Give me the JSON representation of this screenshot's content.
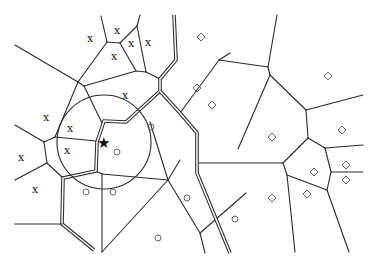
{
  "diagram": {
    "classes": [
      {
        "name": "x",
        "marker": "x"
      },
      {
        "name": "circle",
        "marker": "o"
      },
      {
        "name": "diamond",
        "marker": "◇"
      }
    ],
    "query_point": {
      "marker": "★",
      "x": 104,
      "y": 142
    },
    "query_circle": {
      "cx": 104,
      "cy": 142,
      "r": 47
    },
    "x_points": [
      {
        "label": "x",
        "x": 91,
        "y": 38
      },
      {
        "label": "x",
        "x": 119,
        "y": 31
      },
      {
        "label": "x",
        "x": 133,
        "y": 43
      },
      {
        "label": "x",
        "x": 150,
        "y": 42
      },
      {
        "label": "x",
        "x": 115,
        "y": 56
      },
      {
        "label": "x",
        "x": 126,
        "y": 96
      },
      {
        "label": "x",
        "x": 47,
        "y": 117
      },
      {
        "label": "x",
        "x": 71,
        "y": 128
      },
      {
        "label": "x",
        "x": 68,
        "y": 150
      },
      {
        "label": "x",
        "x": 22,
        "y": 157
      },
      {
        "label": "x",
        "x": 36,
        "y": 189
      }
    ],
    "o_points": [
      {
        "x": 150,
        "y": 127
      },
      {
        "x": 116,
        "y": 152
      },
      {
        "x": 86,
        "y": 192
      },
      {
        "x": 113,
        "y": 192
      },
      {
        "x": 187,
        "y": 198
      },
      {
        "x": 235,
        "y": 218
      },
      {
        "x": 158,
        "y": 238
      }
    ],
    "diamond_points": [
      {
        "x": 201,
        "y": 37
      },
      {
        "x": 328,
        "y": 76
      },
      {
        "x": 197,
        "y": 88
      },
      {
        "x": 212,
        "y": 105
      },
      {
        "x": 272,
        "y": 136
      },
      {
        "x": 342,
        "y": 130
      },
      {
        "x": 342,
        "y": 166
      },
      {
        "x": 342,
        "y": 179
      },
      {
        "x": 314,
        "y": 172
      },
      {
        "x": 307,
        "y": 193
      },
      {
        "x": 272,
        "y": 198
      },
      {
        "x": 352,
        "y": 165
      }
    ]
  }
}
